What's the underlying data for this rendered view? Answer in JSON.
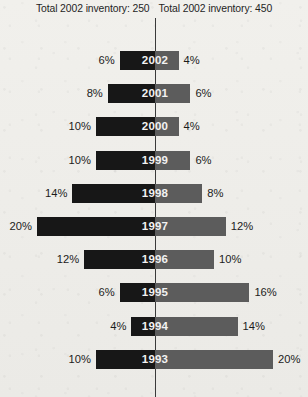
{
  "header": {
    "left_label": "Total 2002 inventory: 250",
    "right_label": "Total 2002 inventory: 450"
  },
  "colors": {
    "left_bar": "#171717",
    "right_bar": "#5c5c5c",
    "axis": "#3a3a3a",
    "background": "#efeeea",
    "year_text": "#f2f2f2",
    "pct_text": "#1c1c1c"
  },
  "axis": {
    "center_x_px": 155,
    "px_per_percent": 5.9
  },
  "chart_data": {
    "type": "bar",
    "subtype": "back-to-back diverging bar (population pyramid style)",
    "title": "",
    "subtitle": "",
    "xlabel": "",
    "ylabel": "",
    "orientation": "horizontal",
    "grid": false,
    "legend_position": "none",
    "categories": [
      "2002",
      "2001",
      "2000",
      "1999",
      "1998",
      "1997",
      "1996",
      "1995",
      "1994",
      "1993"
    ],
    "series": [
      {
        "name": "Total 2002 inventory: 250",
        "side": "left",
        "color": "#171717",
        "values": [
          6,
          8,
          10,
          10,
          14,
          20,
          12,
          6,
          4,
          10
        ],
        "value_labels": [
          "6%",
          "8%",
          "10%",
          "10%",
          "14%",
          "20%",
          "12%",
          "6%",
          "4%",
          "10%"
        ]
      },
      {
        "name": "Total 2002 inventory: 450",
        "side": "right",
        "color": "#5c5c5c",
        "values": [
          4,
          6,
          4,
          6,
          8,
          12,
          10,
          16,
          14,
          20
        ],
        "value_labels": [
          "4%",
          "6%",
          "4%",
          "6%",
          "8%",
          "12%",
          "10%",
          "16%",
          "14%",
          "20%"
        ]
      }
    ],
    "xlim": [
      -20,
      20
    ],
    "units": "percent",
    "annotations": [
      "Total 2002 inventory: 250",
      "Total 2002 inventory: 450"
    ]
  },
  "rows": [
    {
      "year": "2002",
      "left_pct": "6%",
      "right_pct": "4%",
      "left_value": 6,
      "right_value": 4
    },
    {
      "year": "2001",
      "left_pct": "8%",
      "right_pct": "6%",
      "left_value": 8,
      "right_value": 6
    },
    {
      "year": "2000",
      "left_pct": "10%",
      "right_pct": "4%",
      "left_value": 10,
      "right_value": 4
    },
    {
      "year": "1999",
      "left_pct": "10%",
      "right_pct": "6%",
      "left_value": 10,
      "right_value": 6
    },
    {
      "year": "1998",
      "left_pct": "14%",
      "right_pct": "8%",
      "left_value": 14,
      "right_value": 8
    },
    {
      "year": "1997",
      "left_pct": "20%",
      "right_pct": "12%",
      "left_value": 20,
      "right_value": 12
    },
    {
      "year": "1996",
      "left_pct": "12%",
      "right_pct": "10%",
      "left_value": 12,
      "right_value": 10
    },
    {
      "year": "1995",
      "left_pct": "6%",
      "right_pct": "16%",
      "left_value": 6,
      "right_value": 16
    },
    {
      "year": "1994",
      "left_pct": "4%",
      "right_pct": "14%",
      "left_value": 4,
      "right_value": 14
    },
    {
      "year": "1993",
      "left_pct": "10%",
      "right_pct": "20%",
      "left_value": 10,
      "right_value": 20
    }
  ]
}
